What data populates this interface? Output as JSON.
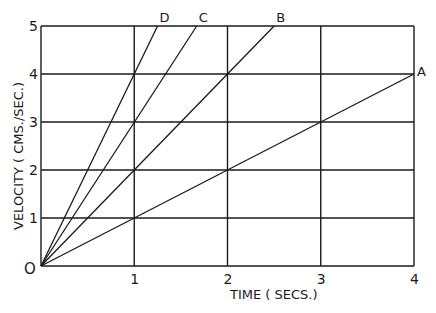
{
  "chart_data": {
    "type": "line",
    "title": "",
    "xlabel": "TIME ( SECS.)",
    "ylabel": "VELOCITY ( CMS./SEC.)",
    "xlim": [
      0,
      4
    ],
    "ylim": [
      0,
      5
    ],
    "x_ticks": [
      "1",
      "2",
      "3",
      "4"
    ],
    "y_ticks": [
      "1",
      "2",
      "3",
      "4",
      "5"
    ],
    "origin_label": "O",
    "grid": true,
    "legend": "inline labels at line ends",
    "series": [
      {
        "name": "A",
        "x": [
          0,
          4
        ],
        "y": [
          0,
          4
        ],
        "slope": 1
      },
      {
        "name": "B",
        "x": [
          0,
          2.5
        ],
        "y": [
          0,
          5
        ],
        "slope": 2
      },
      {
        "name": "C",
        "x": [
          0,
          1.67
        ],
        "y": [
          0,
          5
        ],
        "slope": 3
      },
      {
        "name": "D",
        "x": [
          0,
          1.25
        ],
        "y": [
          0,
          5
        ],
        "slope": 4
      }
    ]
  },
  "colors": {
    "ink": "#1a1a1a",
    "background": "#ffffff"
  }
}
